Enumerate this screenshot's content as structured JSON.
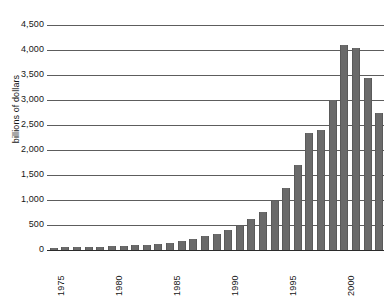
{
  "chart_data": {
    "type": "bar",
    "title": "",
    "xlabel": "",
    "ylabel": "billions of dollars",
    "ylim": [
      0,
      4500
    ],
    "xlim": [
      1975,
      2003
    ],
    "grid": true,
    "legend": "none",
    "y_ticks": [
      0,
      500,
      1000,
      1500,
      2000,
      2500,
      3000,
      3500,
      4000,
      4500
    ],
    "y_tick_labels": [
      "0",
      "500",
      "1,000",
      "1,500",
      "2,000",
      "2,500",
      "3,000",
      "3,500",
      "4,000",
      "4,500"
    ],
    "x_tick_labels": [
      "1975",
      "1980",
      "1985",
      "1990",
      "1995",
      "2000"
    ],
    "x_tick_years": [
      1975,
      1980,
      1985,
      1990,
      1995,
      2000
    ],
    "bar_color": "#6a6a6a",
    "grid_color": "#5d5d5d",
    "categories": [
      1975,
      1976,
      1977,
      1978,
      1979,
      1980,
      1981,
      1982,
      1983,
      1984,
      1985,
      1986,
      1987,
      1988,
      1989,
      1990,
      1991,
      1992,
      1993,
      1994,
      1995,
      1996,
      1997,
      1998,
      1999,
      2000,
      2001,
      2002,
      2003
    ],
    "values": [
      50,
      55,
      60,
      65,
      70,
      80,
      90,
      100,
      110,
      130,
      150,
      190,
      230,
      280,
      320,
      400,
      480,
      620,
      760,
      980,
      1250,
      1700,
      2350,
      2400,
      3000,
      4100,
      4050,
      3450,
      2750
    ]
  }
}
